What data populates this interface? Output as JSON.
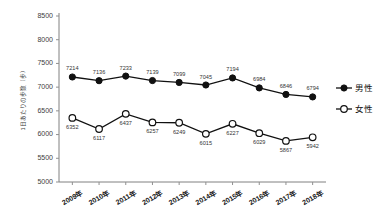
{
  "chart_data": {
    "type": "line",
    "title": "",
    "xlabel": "",
    "ylabel": "1日あたりの歩数（歩）",
    "ylim": [
      5000,
      8500
    ],
    "yticks": [
      5000,
      5500,
      6000,
      6500,
      7000,
      7500,
      8000,
      8500
    ],
    "ytick_labels": [
      "5000",
      "5500",
      "6000",
      "6500",
      "7000",
      "7500",
      "8000",
      "8500"
    ],
    "grid": false,
    "legend_position": "right",
    "categories": [
      "2009年",
      "2010年",
      "2011年",
      "2012年",
      "2013年",
      "2014年",
      "2015年",
      "2016年",
      "2017年",
      "2018年"
    ],
    "series": [
      {
        "name": "男性",
        "marker": "filled-circle",
        "color": "#111111",
        "values": [
          7214,
          7136,
          7233,
          7139,
          7099,
          7045,
          7194,
          6984,
          6846,
          6794
        ],
        "label_positions": [
          "above",
          "above",
          "above",
          "above",
          "above",
          "above",
          "above",
          "above",
          "above",
          "above"
        ]
      },
      {
        "name": "女性",
        "marker": "hollow-circle",
        "color": "#111111",
        "values": [
          6352,
          6117,
          6437,
          6257,
          6249,
          6015,
          6227,
          6029,
          5867,
          5942
        ],
        "label_positions": [
          "below",
          "below",
          "below",
          "below",
          "below",
          "below",
          "below",
          "below",
          "below",
          "below"
        ]
      }
    ]
  },
  "legend": {
    "items": [
      {
        "label": "男性",
        "marker": "filled-circle"
      },
      {
        "label": "女性",
        "marker": "hollow-circle"
      }
    ]
  },
  "axes": {
    "y_title": "1日あたりの歩数（歩）"
  }
}
